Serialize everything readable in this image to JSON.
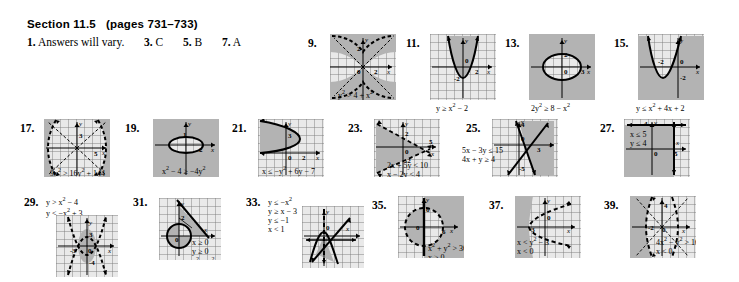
{
  "header": {
    "section": "Section 11.5",
    "pages": "(pages 731–733)"
  },
  "short_answers": [
    {
      "num": "1.",
      "text": "Answers will vary."
    },
    {
      "num": "3.",
      "text": "C"
    },
    {
      "num": "5.",
      "text": "B"
    },
    {
      "num": "7.",
      "text": "A"
    }
  ],
  "problems": [
    {
      "num": "9.",
      "equations": [
        "y² > 4 + x²"
      ],
      "eq_html": "y<sup>2</sup> &gt; 4 + x<sup>2</sup>",
      "eq_position": "below-axis-inside",
      "graph_type": "hyperbola-vertical-dashed",
      "shaded": "interior-branches",
      "tick_labels": [
        "2",
        "0",
        "2"
      ],
      "axis_labels": [
        "y",
        "x"
      ]
    },
    {
      "num": "11.",
      "equations": [
        "y ≥ x² − 2"
      ],
      "eq_html": "y &ge; x<sup>2</sup> &minus; 2",
      "eq_position": "below-box",
      "graph_type": "parabola-up-solid",
      "shaded": "interior-above",
      "tick_labels": [
        "0",
        "2",
        "-2"
      ],
      "axis_labels": [
        "y",
        "x"
      ]
    },
    {
      "num": "13.",
      "equations": [
        "2y² ≥ 8 − x²"
      ],
      "eq_html": "2y<sup>2</sup> &ge; 8 &minus; x<sup>2</sup>",
      "eq_position": "below-box",
      "graph_type": "ellipse-solid",
      "shaded": "exterior",
      "tick_labels": [
        "2",
        "0",
        "3"
      ],
      "axis_labels": [
        "y",
        "x"
      ]
    },
    {
      "num": "15.",
      "equations": [
        "y ≤ x² + 4x + 2"
      ],
      "eq_html": "y &le; x<sup>2</sup> + 4x + 2",
      "eq_position": "below-box",
      "graph_type": "parabola-up-shifted-solid",
      "shaded": "exterior-below",
      "tick_labels": [
        "-2",
        "0",
        "-2"
      ],
      "axis_labels": [
        "y",
        "x"
      ]
    },
    {
      "num": "17.",
      "equations": [
        "9x² > 16y² + 144"
      ],
      "eq_html": "9x<sup>2</sup> &gt; 16y<sup>2</sup> + 144",
      "eq_position": "below-box",
      "graph_type": "hyperbola-horizontal-dashed",
      "shaded": "left-right-branches",
      "tick_labels": [
        "3",
        "5"
      ],
      "axis_labels": [
        "y",
        "x"
      ]
    },
    {
      "num": "19.",
      "equations": [
        "x² − 4 ≥ −4y²"
      ],
      "eq_html": "x<sup>2</sup> &minus; 4 &ge; &minus;4y<sup>2</sup>",
      "eq_position": "below-box",
      "graph_type": "ellipse-wide-solid",
      "shaded": "exterior",
      "tick_labels": [
        "1",
        "2"
      ],
      "axis_labels": [
        "y",
        "x"
      ]
    },
    {
      "num": "21.",
      "equations": [
        "x ≤ −y² + 6y − 7"
      ],
      "eq_html": "x &le; &minus;y<sup>2</sup> + 6y &minus; 7",
      "eq_position": "below-box",
      "graph_type": "parabola-left-solid",
      "shaded": "left-region",
      "tick_labels": [
        "3",
        "0",
        "2"
      ],
      "axis_labels": [
        "y",
        "x"
      ]
    },
    {
      "num": "23.",
      "equations": [
        "2x + 5y < 10",
        "x − 2y < 4"
      ],
      "eq_html": "2x + 5y &lt; 10<br>x &minus; 2y &lt; 4",
      "eq_position": "below-box",
      "graph_type": "two-dashed-lines",
      "shaded": "wedge-left",
      "tick_labels": [
        "2",
        "0",
        "5",
        "-2"
      ],
      "axis_labels": [
        "y",
        "x"
      ]
    },
    {
      "num": "25.",
      "equations": [
        "5x − 3y ≤ 15",
        "4x + y ≥ 4"
      ],
      "eq_html": "5x &minus; 3y &le; 15<br>4x + y &ge; 4",
      "eq_position": "left-inside",
      "graph_type": "two-solid-lines",
      "shaded": "right-wedge",
      "tick_labels": [
        "4",
        "0",
        "3",
        "-5"
      ],
      "axis_labels": [
        "y",
        "x"
      ]
    },
    {
      "num": "27.",
      "equations": [
        "x ≤ 5",
        "y ≤ 4"
      ],
      "eq_html": "x &le; 5<br>y &le; 4",
      "eq_position": "upper-left-inside",
      "graph_type": "vertical-horizontal-solid",
      "shaded": "lower-left",
      "tick_labels": [
        "4",
        "0",
        "5"
      ],
      "axis_labels": [
        "y",
        "x"
      ]
    },
    {
      "num": "29.",
      "equations": [
        "y > x² − 4",
        "y < −x² + 3"
      ],
      "eq_html": "y &gt; x<sup>2</sup> &minus; 4<br>y &lt; &minus;x<sup>2</sup> + 3",
      "eq_position": "above-box",
      "graph_type": "two-parabolas-dashed",
      "shaded": "lens-center",
      "tick_labels": [
        "3",
        "-3",
        "0",
        "-4"
      ],
      "axis_labels": [
        "y",
        "x"
      ]
    },
    {
      "num": "31.",
      "equations": [
        "x ≥ 0",
        "y ≥ 0",
        "x² + y² ≥ 4",
        "x + y ≤ 5"
      ],
      "eq_html": "x &ge; 0<br>y &ge; 0<br>x<sup>2</sup> + y<sup>2</sup> &ge; 4<br>x + y &le; 5",
      "eq_position": "inside-right-and-below",
      "graph_type": "circle-and-line",
      "shaded": "triangle-minus-circle",
      "tick_labels": [
        "2",
        "0"
      ],
      "axis_labels": [
        "y",
        "x"
      ]
    },
    {
      "num": "33.",
      "equations": [
        "y ≤ −x²",
        "y ≥ x − 3",
        "y ≤ −1",
        "x < 1"
      ],
      "eq_html": "y &le; &minus;x<sup>2</sup><br>y &ge; x &minus; 3<br>y &le; &minus;1<br>x &lt; 1",
      "eq_position": "left-of-box",
      "graph_type": "parabola-down-line-mixed",
      "shaded": "small-wedge",
      "tick_labels": [
        "0"
      ],
      "axis_labels": [
        "y",
        "x"
      ]
    },
    {
      "num": "35.",
      "equations": [
        "x² + y² > 36",
        "x ≥ 0"
      ],
      "eq_html": "x<sup>2</sup> + y<sup>2</sup> &gt; 36<br>x &ge; 0",
      "eq_position": "inside-lower-right",
      "graph_type": "circle-dashed",
      "shaded": "right-exterior",
      "tick_labels": [
        "6",
        "0",
        "6"
      ],
      "axis_labels": [
        "y",
        "x"
      ]
    },
    {
      "num": "37.",
      "equations": [
        "x < y² − 3",
        "x < 0"
      ],
      "eq_html": "x &lt; y<sup>2</sup> &minus; 3<br>x &lt; 0",
      "eq_position": "inside-lower-left",
      "graph_type": "parabola-right-dashed",
      "shaded": "left-of-parabola",
      "tick_labels": [
        "-3",
        "0"
      ],
      "axis_labels": [
        "y",
        "x"
      ]
    },
    {
      "num": "39.",
      "equations": [
        "4x² − y² > 16",
        "x < 0"
      ],
      "eq_html": "4x<sup>2</sup> &minus; y<sup>2</sup> &gt; 16<br>x &lt; 0",
      "eq_position": "inside-lower-right",
      "graph_type": "hyperbola-horizontal-dashed-left",
      "shaded": "left-branch",
      "tick_labels": [
        "4",
        "-2",
        "0"
      ],
      "axis_labels": [
        "y",
        "x"
      ]
    }
  ],
  "colors": {
    "page_background": "#ffffff",
    "grid_fill": "#e9e9e9",
    "grid_line": "#8a8a8a",
    "shade_fill": "#b9b9b9",
    "curve": "#000000",
    "text": "#000000"
  }
}
